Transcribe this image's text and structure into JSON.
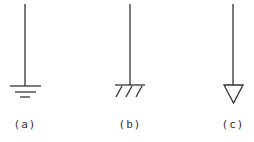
{
  "diagram": {
    "type": "ground-symbols",
    "stroke_color": "#333333",
    "background": "#ffffff",
    "symbols": [
      {
        "id": "a",
        "name": "earth-ground",
        "label": "(a)"
      },
      {
        "id": "b",
        "name": "chassis-ground",
        "label": "(b)"
      },
      {
        "id": "c",
        "name": "signal-ground",
        "label": "(c)"
      }
    ]
  }
}
